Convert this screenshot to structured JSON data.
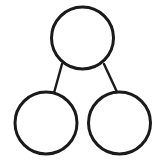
{
  "page": {
    "background_color": "#ffffff",
    "width": 164,
    "height": 168
  },
  "diagram": {
    "type": "number-bond",
    "stroke_color": "#1a1a1a",
    "fill_color": "#ffffff",
    "circle_stroke_width": 3,
    "line_stroke_width": 2.4,
    "nodes": [
      {
        "id": "whole",
        "role": "whole",
        "label": "",
        "cx": 82.5,
        "cy": 38,
        "r": 31
      },
      {
        "id": "part-left",
        "role": "part",
        "label": "",
        "cx": 46,
        "cy": 123,
        "r": 31
      },
      {
        "id": "part-right",
        "role": "part",
        "label": "",
        "cx": 119.5,
        "cy": 123,
        "r": 31
      }
    ],
    "connectors": [
      {
        "id": "whole-to-part-left",
        "from": "whole",
        "to": "part-left",
        "x1": 62,
        "y1": 64,
        "x2": 54,
        "y2": 93
      },
      {
        "id": "whole-to-part-right",
        "from": "whole",
        "to": "part-right",
        "x1": 104,
        "y1": 64,
        "x2": 117,
        "y2": 92
      }
    ]
  }
}
